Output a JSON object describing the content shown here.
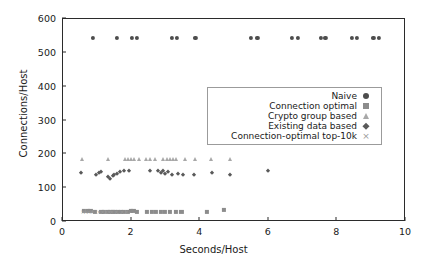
{
  "chart_data": {
    "type": "scatter",
    "title": "",
    "xlabel": "Seconds/Host",
    "ylabel": "Connections/Host",
    "xlim": [
      0,
      10
    ],
    "ylim": [
      0,
      600
    ],
    "xticks": [
      0,
      2,
      4,
      6,
      8,
      10
    ],
    "yticks": [
      0,
      100,
      200,
      300,
      400,
      500,
      600
    ],
    "xtick_labels": [
      "0",
      "2",
      "4",
      "6",
      "8",
      "10"
    ],
    "ytick_labels": [
      "0",
      "100",
      "200",
      "300",
      "400",
      "500",
      "600"
    ],
    "grid": false,
    "legend_position": "center-right",
    "series": [
      {
        "name": "Naive",
        "marker": "circle",
        "color": "#4d4d4d",
        "points": [
          [
            0.88,
            545
          ],
          [
            1.58,
            545
          ],
          [
            2.02,
            545
          ],
          [
            2.15,
            545
          ],
          [
            3.18,
            545
          ],
          [
            3.32,
            545
          ],
          [
            3.86,
            545
          ],
          [
            5.48,
            545
          ],
          [
            5.67,
            545
          ],
          [
            6.68,
            545
          ],
          [
            6.86,
            545
          ],
          [
            7.52,
            545
          ],
          [
            7.65,
            545
          ],
          [
            8.42,
            545
          ],
          [
            8.58,
            545
          ],
          [
            9.05,
            545
          ],
          [
            9.2,
            545
          ]
        ]
      },
      {
        "name": "Connection optimal",
        "marker": "square",
        "color": "#8c8c8c",
        "points": [
          [
            0.62,
            32
          ],
          [
            0.72,
            32
          ],
          [
            0.8,
            32
          ],
          [
            0.92,
            31
          ],
          [
            1.12,
            31
          ],
          [
            1.2,
            31
          ],
          [
            1.3,
            31
          ],
          [
            1.38,
            30
          ],
          [
            1.45,
            30
          ],
          [
            1.52,
            30
          ],
          [
            1.6,
            31
          ],
          [
            1.68,
            30
          ],
          [
            1.78,
            31
          ],
          [
            1.9,
            31
          ],
          [
            1.98,
            32
          ],
          [
            2.05,
            32
          ],
          [
            2.15,
            31
          ],
          [
            2.45,
            31
          ],
          [
            2.6,
            31
          ],
          [
            2.72,
            31
          ],
          [
            2.85,
            31
          ],
          [
            2.98,
            31
          ],
          [
            3.12,
            31
          ],
          [
            3.3,
            31
          ],
          [
            3.45,
            30
          ],
          [
            4.2,
            30
          ],
          [
            4.7,
            35
          ]
        ]
      },
      {
        "name": "Crypto group based",
        "marker": "triangle",
        "color": "#a8a8a8",
        "points": [
          [
            0.55,
            186
          ],
          [
            1.32,
            186
          ],
          [
            1.82,
            185
          ],
          [
            1.9,
            185
          ],
          [
            1.98,
            185
          ],
          [
            2.08,
            185
          ],
          [
            2.22,
            185
          ],
          [
            2.42,
            185
          ],
          [
            2.55,
            185
          ],
          [
            2.68,
            185
          ],
          [
            2.92,
            185
          ],
          [
            3.02,
            185
          ],
          [
            3.12,
            185
          ],
          [
            3.22,
            185
          ],
          [
            3.3,
            185
          ],
          [
            3.55,
            185
          ],
          [
            3.85,
            185
          ],
          [
            4.32,
            185
          ],
          [
            4.88,
            185
          ]
        ]
      },
      {
        "name": "Existing data based",
        "marker": "diamond",
        "color": "#5a5a5a",
        "points": [
          [
            0.52,
            144
          ],
          [
            0.95,
            140
          ],
          [
            1.05,
            145
          ],
          [
            1.12,
            148
          ],
          [
            1.3,
            133
          ],
          [
            1.38,
            128
          ],
          [
            1.45,
            136
          ],
          [
            1.5,
            140
          ],
          [
            1.58,
            143
          ],
          [
            1.65,
            148
          ],
          [
            1.78,
            152
          ],
          [
            1.92,
            152
          ],
          [
            2.55,
            150
          ],
          [
            2.78,
            150
          ],
          [
            2.85,
            146
          ],
          [
            2.92,
            152
          ],
          [
            2.98,
            143
          ],
          [
            3.05,
            148
          ],
          [
            3.18,
            140
          ],
          [
            3.35,
            142
          ],
          [
            3.5,
            139
          ],
          [
            3.82,
            138
          ],
          [
            4.35,
            146
          ],
          [
            4.88,
            140
          ],
          [
            5.98,
            151
          ]
        ]
      },
      {
        "name": "Connection-optimal top-10k",
        "marker": "cross",
        "color": "#9a9a9a",
        "points": [
          [
            0.58,
            33
          ],
          [
            0.66,
            33
          ],
          [
            0.75,
            33
          ],
          [
            0.85,
            33
          ],
          [
            1.05,
            33
          ],
          [
            1.15,
            32
          ],
          [
            1.25,
            32
          ],
          [
            1.35,
            32
          ],
          [
            1.42,
            32
          ],
          [
            1.55,
            32
          ],
          [
            1.72,
            32
          ],
          [
            1.85,
            33
          ]
        ]
      }
    ]
  },
  "legend": {
    "entries": [
      {
        "label": "Naive",
        "marker": "circle"
      },
      {
        "label": "Connection optimal",
        "marker": "square"
      },
      {
        "label": "Crypto group based",
        "marker": "triangle"
      },
      {
        "label": "Existing data based",
        "marker": "diamond"
      },
      {
        "label": "Connection-optimal top-10k",
        "marker": "cross"
      }
    ]
  }
}
